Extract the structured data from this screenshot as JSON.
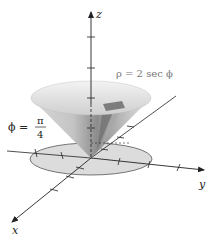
{
  "figure": {
    "type": "3d-surface-diagram",
    "axes": {
      "x_label": "x",
      "y_label": "y",
      "z_label": "z"
    },
    "annotations": {
      "surface_equation": "ρ = 2 sec ϕ",
      "angle_label_lhs": "ϕ =",
      "angle_numerator": "π",
      "angle_denominator": "4"
    },
    "colors": {
      "axis": "#222222",
      "cone_light": "#e6e6e6",
      "cone_mid": "#bdbdbd",
      "cone_dark": "#7a7a7a",
      "disk_fill": "#dcdcdc",
      "disk_stroke": "#555555",
      "label_gray": "#777777"
    }
  }
}
